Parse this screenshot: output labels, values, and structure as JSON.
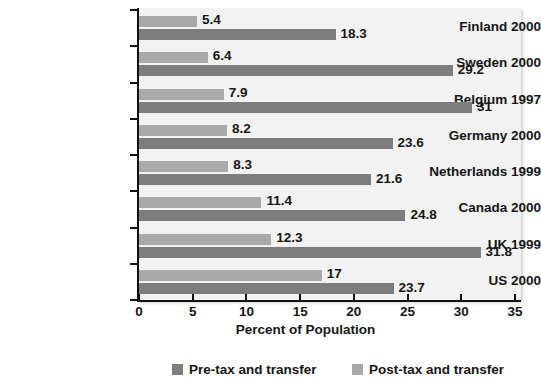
{
  "chart_data": {
    "type": "bar",
    "orientation": "horizontal",
    "title": "",
    "xlabel": "Percent of Population",
    "ylabel": "",
    "xlim": [
      0,
      35
    ],
    "xticks": [
      0,
      5,
      10,
      15,
      20,
      25,
      30,
      35
    ],
    "grid": false,
    "legend_position": "bottom",
    "categories": [
      "Finland 2000",
      "Sweden 2000",
      "Belgium 1997",
      "Germany 2000",
      "Netherlands 1999",
      "Canada 2000",
      "UK 1999",
      "US 2000"
    ],
    "series": [
      {
        "name": "Pre-tax and transfer",
        "color": "#7d7d7d",
        "values": [
          18.3,
          29.2,
          31,
          23.6,
          21.6,
          24.8,
          31.8,
          23.7
        ],
        "labels": [
          "18.3",
          "29.2",
          "31",
          "23.6",
          "21.6",
          "24.8",
          "31.8",
          "23.7"
        ]
      },
      {
        "name": "Post-tax and transfer",
        "color": "#a9a9a9",
        "values": [
          5.4,
          6.4,
          7.9,
          8.2,
          8.3,
          11.4,
          12.3,
          17
        ],
        "labels": [
          "5.4",
          "6.4",
          "7.9",
          "8.2",
          "8.3",
          "11.4",
          "12.3",
          "17"
        ]
      }
    ]
  },
  "axis": {
    "tick_labels": [
      "0",
      "5",
      "10",
      "15",
      "20",
      "25",
      "30",
      "35"
    ],
    "x_axis_title": "Percent of Population"
  },
  "legend": {
    "items": [
      {
        "label": "Pre-tax and transfer",
        "color": "#7d7d7d"
      },
      {
        "label": "Post-tax and transfer",
        "color": "#a9a9a9"
      }
    ]
  }
}
